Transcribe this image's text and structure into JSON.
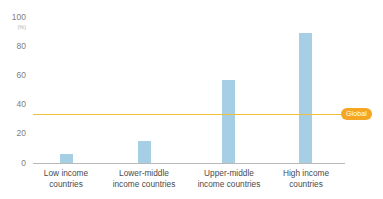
{
  "chart_data": {
    "type": "bar",
    "title": "",
    "subtitle": "",
    "xlabel": "",
    "ylabel": "",
    "unit_label": "(%)",
    "ylim": [
      0,
      100
    ],
    "yticks": [
      0,
      20,
      40,
      60,
      80,
      100
    ],
    "ytick_labels": [
      "0",
      "20",
      "40",
      "60",
      "80",
      "100"
    ],
    "grid": false,
    "legend": "none",
    "bar_color": "#a6cee4",
    "categories": [
      "Low income countries",
      "Lower-middle income countries",
      "Upper-middle income countries",
      "High income countries"
    ],
    "category_lines": [
      [
        "Low income",
        "countries"
      ],
      [
        "Lower-middle",
        "income countries"
      ],
      [
        "Upper-middle",
        "income countries"
      ],
      [
        "High income",
        "countries"
      ]
    ],
    "values": [
      6,
      15,
      57,
      89
    ],
    "reference_line": {
      "label": "Global",
      "value": 33,
      "line_color": "#f0c03c",
      "badge_color": "#f5a623",
      "badge_text_color": "#ffffff"
    }
  }
}
